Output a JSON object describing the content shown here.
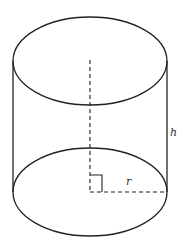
{
  "diagram": {
    "type": "cylinder",
    "colors": {
      "stroke": "#222222",
      "background": "#ffffff",
      "label": "#333333"
    },
    "labels": {
      "height": "h",
      "radius": "r"
    },
    "geometry": {
      "top_ellipse": {
        "cx": 90,
        "cy": 61,
        "rx": 77,
        "ry": 44
      },
      "bottom_ellipse": {
        "cx": 90,
        "cy": 192,
        "rx": 77,
        "ry": 44
      },
      "axis": "dashed",
      "radius_line": "dashed",
      "right_angle_marker": true
    }
  }
}
